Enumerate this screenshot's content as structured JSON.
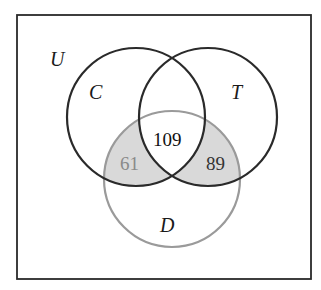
{
  "diagram": {
    "type": "venn",
    "universe_label": "U",
    "sets": [
      {
        "name": "C",
        "label": "C",
        "stroke": "#2a2a2a"
      },
      {
        "name": "T",
        "label": "T",
        "stroke": "#2a2a2a"
      },
      {
        "name": "D",
        "label": "D",
        "stroke": "#9a9a9a"
      }
    ],
    "regions": [
      {
        "name": "C_and_T_and_D",
        "value": "109",
        "color": "#111111",
        "shaded": false
      },
      {
        "name": "C_and_D_only",
        "value": "61",
        "color": "#8a8a8a",
        "shaded": true
      },
      {
        "name": "T_and_D_only",
        "value": "89",
        "color": "#333333",
        "shaded": true
      }
    ],
    "shade_color": "#d9d9d9"
  }
}
